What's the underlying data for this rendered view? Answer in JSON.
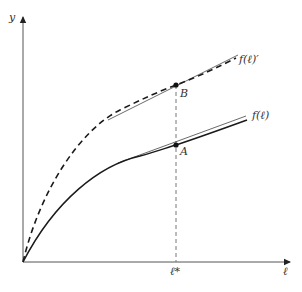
{
  "figure": {
    "type": "production-function-diagram",
    "axes": {
      "y_label": "y",
      "x_label": "ℓ"
    },
    "curves": [
      {
        "id": "f_prime",
        "label": "f(ℓ)′",
        "style": "dashed"
      },
      {
        "id": "f",
        "label": "f(ℓ)",
        "style": "solid"
      }
    ],
    "points": [
      {
        "id": "A",
        "label": "A",
        "on_curve": "f"
      },
      {
        "id": "B",
        "label": "B",
        "on_curve": "f_prime"
      }
    ],
    "x_marker": {
      "label": "ℓ*",
      "style": "dashed-vertical"
    },
    "tangents": [
      {
        "at": "A",
        "style": "thin-solid"
      },
      {
        "at": "B",
        "style": "thin-solid"
      }
    ],
    "colors": {
      "curve": "#1a1a1a",
      "axis": "#555555",
      "tangent": "#444444",
      "guide": "#777777"
    }
  }
}
